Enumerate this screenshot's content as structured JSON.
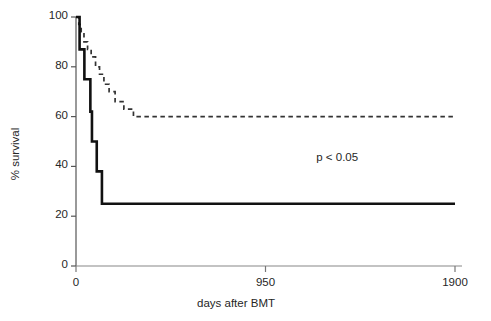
{
  "chart_data": {
    "type": "line",
    "subtype": "kaplan-meier-step",
    "title": "",
    "xlabel": "days after BMT",
    "ylabel": "% survival",
    "xlim": [
      0,
      1900
    ],
    "ylim": [
      0,
      100
    ],
    "xticks": [
      0,
      950,
      1900
    ],
    "xtick_labels": [
      "0",
      "950",
      "1900"
    ],
    "yticks": [
      0,
      20,
      40,
      60,
      80,
      100
    ],
    "ytick_labels": [
      "0",
      "20",
      "40",
      "60",
      "80",
      "100"
    ],
    "grid": false,
    "legend": "none",
    "annotations": [
      {
        "text": "p < 0.05",
        "x": 1380,
        "y": 43
      }
    ],
    "series": [
      {
        "name": "solid-curve",
        "style": "solid",
        "color": "#111111",
        "linewidth": 2.6,
        "points": [
          {
            "x": 0,
            "y": 100
          },
          {
            "x": 18,
            "y": 100
          },
          {
            "x": 18,
            "y": 87
          },
          {
            "x": 42,
            "y": 87
          },
          {
            "x": 42,
            "y": 75
          },
          {
            "x": 72,
            "y": 75
          },
          {
            "x": 72,
            "y": 62
          },
          {
            "x": 80,
            "y": 62
          },
          {
            "x": 80,
            "y": 50
          },
          {
            "x": 104,
            "y": 50
          },
          {
            "x": 104,
            "y": 38
          },
          {
            "x": 130,
            "y": 38
          },
          {
            "x": 130,
            "y": 25
          },
          {
            "x": 1900,
            "y": 25
          }
        ]
      },
      {
        "name": "dashed-curve",
        "style": "dashed",
        "color": "#333333",
        "linewidth": 1.7,
        "points": [
          {
            "x": 0,
            "y": 100
          },
          {
            "x": 14,
            "y": 100
          },
          {
            "x": 14,
            "y": 97
          },
          {
            "x": 26,
            "y": 97
          },
          {
            "x": 26,
            "y": 94
          },
          {
            "x": 40,
            "y": 94
          },
          {
            "x": 40,
            "y": 90
          },
          {
            "x": 58,
            "y": 90
          },
          {
            "x": 58,
            "y": 87
          },
          {
            "x": 76,
            "y": 87
          },
          {
            "x": 76,
            "y": 84
          },
          {
            "x": 98,
            "y": 84
          },
          {
            "x": 98,
            "y": 80
          },
          {
            "x": 118,
            "y": 80
          },
          {
            "x": 118,
            "y": 77
          },
          {
            "x": 140,
            "y": 77
          },
          {
            "x": 140,
            "y": 73
          },
          {
            "x": 166,
            "y": 73
          },
          {
            "x": 166,
            "y": 70
          },
          {
            "x": 196,
            "y": 70
          },
          {
            "x": 196,
            "y": 66
          },
          {
            "x": 240,
            "y": 66
          },
          {
            "x": 240,
            "y": 63
          },
          {
            "x": 288,
            "y": 63
          },
          {
            "x": 288,
            "y": 60
          },
          {
            "x": 1900,
            "y": 60
          }
        ]
      }
    ]
  },
  "axes": {
    "y_title": "% survival",
    "x_title": "days after BMT"
  }
}
